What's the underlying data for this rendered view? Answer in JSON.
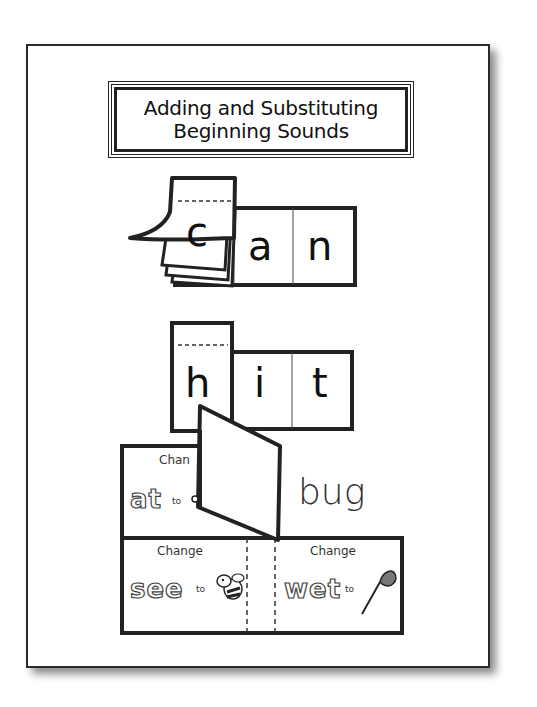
{
  "title": {
    "line1": "Adding and Substituting",
    "line2": "Beginning Sounds"
  },
  "example1": {
    "flap_letter": "c",
    "hidden_letter": "r",
    "letters": [
      "a",
      "n"
    ]
  },
  "example2": {
    "letters": [
      "h",
      "i",
      "t"
    ]
  },
  "cards": {
    "top_left": {
      "label": "Chan",
      "word": "at",
      "to": "to",
      "icon": "cat-icon"
    },
    "top_right": {
      "word": "bug"
    },
    "bottom_left": {
      "label": "Change",
      "word": "see",
      "to": "to",
      "icon": "bee-icon"
    },
    "bottom_right": {
      "label": "Change",
      "word": "wet",
      "to": "to",
      "icon": "net-icon"
    }
  },
  "colors": {
    "ink": "#222222",
    "paper": "#ffffff"
  }
}
